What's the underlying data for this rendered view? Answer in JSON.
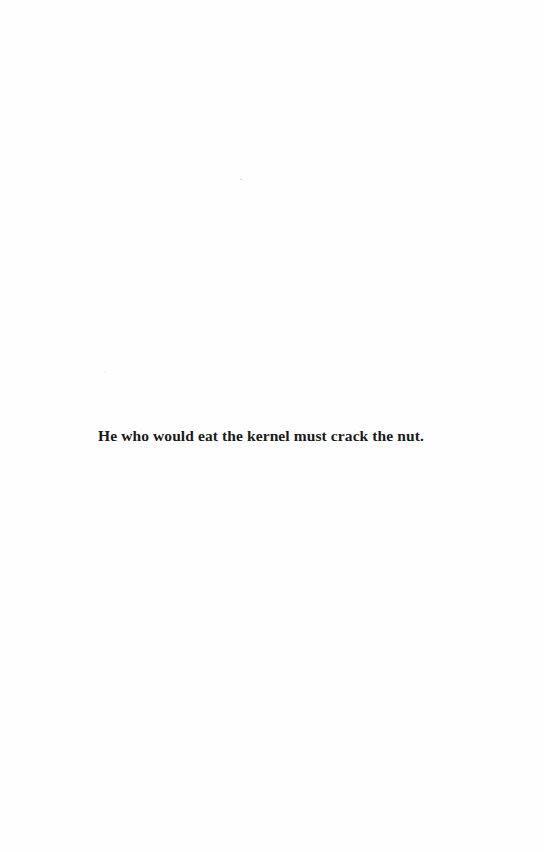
{
  "page": {
    "epigraph": "He who would eat the kernel must crack the nut."
  }
}
